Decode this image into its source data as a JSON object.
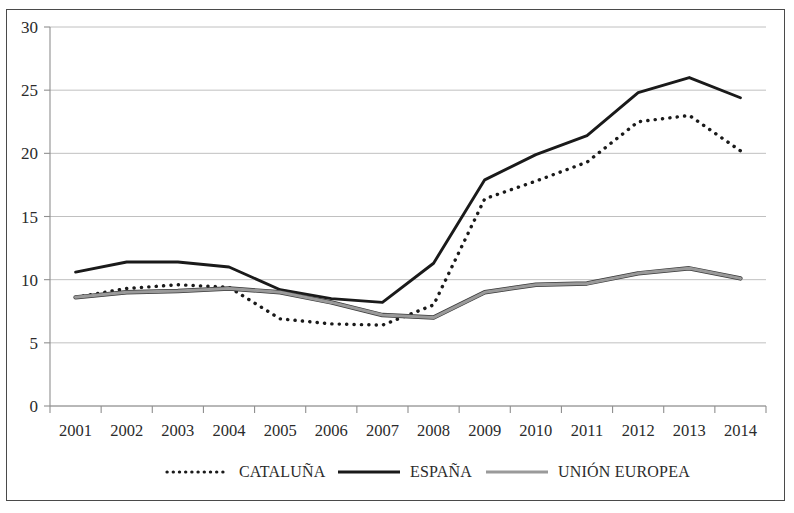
{
  "chart_data": {
    "type": "line",
    "title": "",
    "subtitle": "",
    "xlabel": "",
    "ylabel": "",
    "categories": [
      "2001",
      "2002",
      "2003",
      "2004",
      "2005",
      "2006",
      "2007",
      "2008",
      "2009",
      "2010",
      "2011",
      "2012",
      "2013",
      "2014"
    ],
    "ylim": [
      0,
      30
    ],
    "yticks": [
      0,
      5,
      10,
      15,
      20,
      25,
      30
    ],
    "ytick_labels": [
      "0",
      "5",
      "10",
      "15",
      "20",
      "25",
      "30"
    ],
    "grid": true,
    "grid_axis": "y",
    "legend_position": "bottom",
    "series": [
      {
        "name": "CATALUÑA",
        "style": "dotted",
        "color": "#1a1a1a",
        "values": [
          8.6,
          9.3,
          9.6,
          9.4,
          6.9,
          6.5,
          6.4,
          8.0,
          16.4,
          17.8,
          19.3,
          22.5,
          23.0,
          20.2
        ]
      },
      {
        "name": "ESPAÑA",
        "style": "solid",
        "color": "#1a1a1a",
        "values": [
          10.6,
          11.4,
          11.4,
          11.0,
          9.2,
          8.5,
          8.2,
          11.3,
          17.9,
          19.9,
          21.4,
          24.8,
          26.0,
          24.4
        ]
      },
      {
        "name": "UNIÓN EUROPEA",
        "style": "solid",
        "color": "#9a9a9a",
        "values": [
          8.6,
          9.0,
          9.1,
          9.3,
          9.0,
          8.2,
          7.2,
          7.0,
          9.0,
          9.6,
          9.7,
          10.5,
          10.9,
          10.1
        ]
      }
    ],
    "axis_colors": {
      "gridline": "#b9b9b9",
      "axis": "#8f8f8f",
      "text": "#2b2b2b"
    }
  },
  "legend": {
    "items": [
      {
        "label": "CATALUÑA",
        "icon": "dotted-line-swatch"
      },
      {
        "label": "ESPAÑA",
        "icon": "solid-line-swatch"
      },
      {
        "label": "UNIÓN EUROPEA",
        "icon": "gray-line-swatch"
      }
    ]
  }
}
